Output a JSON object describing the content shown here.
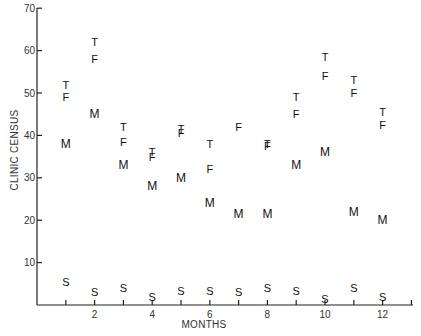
{
  "chart_data": {
    "type": "scatter",
    "title": "",
    "xlabel": "MONTHS",
    "ylabel": "CLINIC CENSUS",
    "xlim": [
      0,
      13
    ],
    "ylim": [
      0,
      70
    ],
    "x_ticks": [
      1,
      2,
      3,
      4,
      5,
      6,
      7,
      8,
      9,
      10,
      11,
      12,
      13
    ],
    "x_tick_labels": [
      "2",
      "4",
      "6",
      "8",
      "10",
      "12"
    ],
    "x_tick_label_positions": [
      2,
      4,
      6,
      8,
      10,
      12
    ],
    "y_ticks": [
      10,
      20,
      30,
      40,
      50,
      60,
      70
    ],
    "y_tick_labels": [
      "10",
      "20",
      "30",
      "40",
      "50",
      "60",
      "70"
    ],
    "grid": false,
    "legend": "none (series plotted as letter markers)",
    "x": [
      1,
      2,
      3,
      4,
      5,
      6,
      7,
      8,
      9,
      10,
      11,
      12
    ],
    "series": [
      {
        "name": "T",
        "marker": "T",
        "values": [
          52,
          62,
          42,
          36,
          41.5,
          38,
          null,
          38,
          49,
          58.5,
          53,
          45.5
        ]
      },
      {
        "name": "F",
        "marker": "F",
        "values": [
          49,
          58,
          38.5,
          35,
          40.5,
          32,
          42,
          37.5,
          45,
          54,
          50,
          42.5
        ]
      },
      {
        "name": "M",
        "marker": "M",
        "values": [
          38,
          45,
          33,
          28,
          30,
          24,
          21.5,
          21.5,
          33,
          36,
          22,
          20
        ]
      },
      {
        "name": "S",
        "marker": "S",
        "values": [
          5.5,
          3,
          4,
          2,
          3.3,
          3.3,
          3.1,
          4,
          3.2,
          1.5,
          4,
          2
        ]
      }
    ]
  }
}
